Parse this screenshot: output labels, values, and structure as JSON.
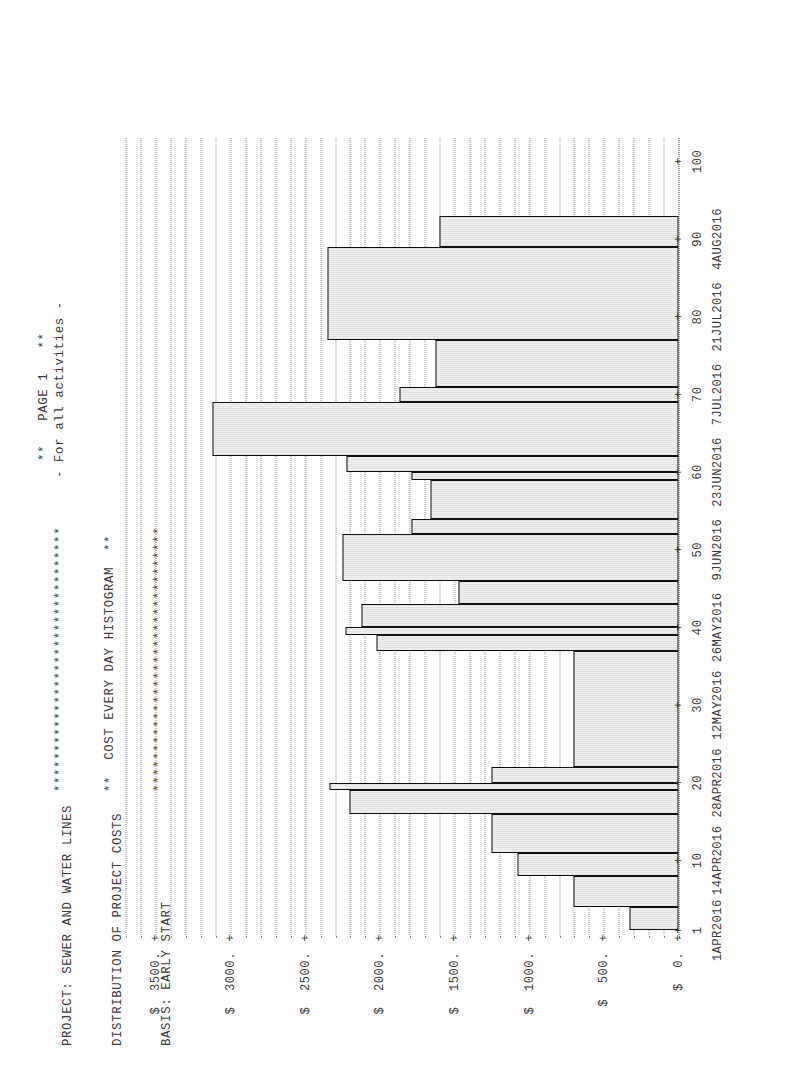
{
  "report": {
    "header_lines": [
      "PROJECT: SEWER AND WATER LINES",
      "DISTRIBUTION OF PROJECT COSTS",
      "BASIS: EARLY START"
    ],
    "banner_lines": [
      "*********************************",
      "**  COST EVERY DAY HISTOGRAM  **",
      "*********************************"
    ],
    "page_mark": "**   PAGE 1   **",
    "subcaption": "- For all activities -"
  },
  "chart_data": {
    "type": "bar",
    "title": "**  COST EVERY DAY HISTOGRAM  **",
    "subtitle": "DISTRIBUTION OF PROJECT COSTS",
    "xlabel": "",
    "ylabel": "$",
    "ylim": [
      0,
      3750
    ],
    "xlim": [
      0,
      103
    ],
    "grid": true,
    "legend": null,
    "y_ticks": [
      {
        "value": 0,
        "label": "0."
      },
      {
        "value": 500,
        "label": "500."
      },
      {
        "value": 1000,
        "label": "1000."
      },
      {
        "value": 1500,
        "label": "1500."
      },
      {
        "value": 2000,
        "label": "2000."
      },
      {
        "value": 2500,
        "label": "2500."
      },
      {
        "value": 3000,
        "label": "3000."
      },
      {
        "value": 3500,
        "label": "3500."
      }
    ],
    "y_tick_prefix": "$",
    "y_minor_step": 100,
    "x_ticks": [
      {
        "value": 1,
        "label": "1",
        "date": "1APR2016"
      },
      {
        "value": 10,
        "label": "10",
        "date": "14APR2016"
      },
      {
        "value": 20,
        "label": "20",
        "date": "28APR2016"
      },
      {
        "value": 30,
        "label": "30",
        "date": "12MAY2016"
      },
      {
        "value": 40,
        "label": "40",
        "date": "26MAY2016"
      },
      {
        "value": 50,
        "label": "50",
        "date": "9JUN2016"
      },
      {
        "value": 60,
        "label": "60",
        "date": "23JUN2016"
      },
      {
        "value": 70,
        "label": "70",
        "date": "7JUL2016"
      },
      {
        "value": 80,
        "label": "80",
        "date": "21JUL2016"
      },
      {
        "value": 90,
        "label": "90",
        "date": "4AUG2016"
      },
      {
        "value": 100,
        "label": "100",
        "date": ""
      }
    ],
    "x_minor_step": 2,
    "bar_color": "#e8e8e8",
    "bar_edge_color": "#111111",
    "bars": [
      {
        "x_start": 1,
        "x_end": 4,
        "value": 330
      },
      {
        "x_start": 4,
        "x_end": 8,
        "value": 700
      },
      {
        "x_start": 8,
        "x_end": 11,
        "value": 1075
      },
      {
        "x_start": 11,
        "x_end": 16,
        "value": 1250
      },
      {
        "x_start": 16,
        "x_end": 19,
        "value": 2200
      },
      {
        "x_start": 19,
        "x_end": 20,
        "value": 2340
      },
      {
        "x_start": 20,
        "x_end": 22,
        "value": 1250
      },
      {
        "x_start": 22,
        "x_end": 37,
        "value": 700
      },
      {
        "x_start": 37,
        "x_end": 39,
        "value": 2025
      },
      {
        "x_start": 39,
        "x_end": 40,
        "value": 2230
      },
      {
        "x_start": 40,
        "x_end": 43,
        "value": 2120
      },
      {
        "x_start": 43,
        "x_end": 46,
        "value": 1470
      },
      {
        "x_start": 46,
        "x_end": 52,
        "value": 2250
      },
      {
        "x_start": 52,
        "x_end": 54,
        "value": 1790
      },
      {
        "x_start": 54,
        "x_end": 59,
        "value": 1660
      },
      {
        "x_start": 59,
        "x_end": 60,
        "value": 1790
      },
      {
        "x_start": 60,
        "x_end": 62,
        "value": 2225
      },
      {
        "x_start": 62,
        "x_end": 69,
        "value": 3120
      },
      {
        "x_start": 69,
        "x_end": 71,
        "value": 1870
      },
      {
        "x_start": 71,
        "x_end": 77,
        "value": 1630
      },
      {
        "x_start": 77,
        "x_end": 89,
        "value": 2350
      },
      {
        "x_start": 89,
        "x_end": 93,
        "value": 1600
      }
    ]
  }
}
